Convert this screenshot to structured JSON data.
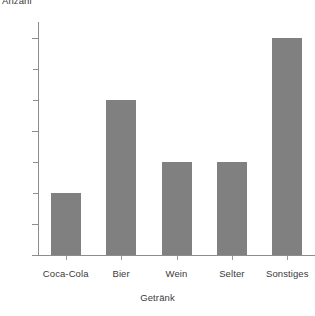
{
  "chart_data": {
    "type": "bar",
    "title": "",
    "xlabel": "Getränk",
    "ylabel": "Anzahl",
    "categories": [
      "Coca-Cola",
      "Bier",
      "Wein",
      "Selter",
      "Sonstiges"
    ],
    "values": [
      2,
      5,
      3,
      3,
      7
    ],
    "ylim": [
      0,
      7.5
    ],
    "yticks": [
      0,
      1,
      2,
      3,
      4,
      5,
      6,
      7
    ],
    "ytick_labels_shown": [
      "0",
      "1",
      "4",
      "7"
    ],
    "ytick_labels": {
      "0": "0",
      "1": "1",
      "2": "",
      "3": "",
      "4": "4",
      "5": "",
      "6": "",
      "7": "7"
    },
    "grid": false,
    "legend": null,
    "bar_color": "#808080",
    "axis_color": "#8d8d8d",
    "text_color": "#3a3a3a",
    "background": "#ffffff"
  },
  "axes": {
    "y_title": "Anzahl",
    "x_title": "Getränk"
  },
  "bars": [
    {
      "label": "Coca-Cola",
      "value": 2
    },
    {
      "label": "Bier",
      "value": 5
    },
    {
      "label": "Wein",
      "value": 3
    },
    {
      "label": "Selter",
      "value": 3
    },
    {
      "label": "Sonstiges",
      "value": 7
    }
  ]
}
